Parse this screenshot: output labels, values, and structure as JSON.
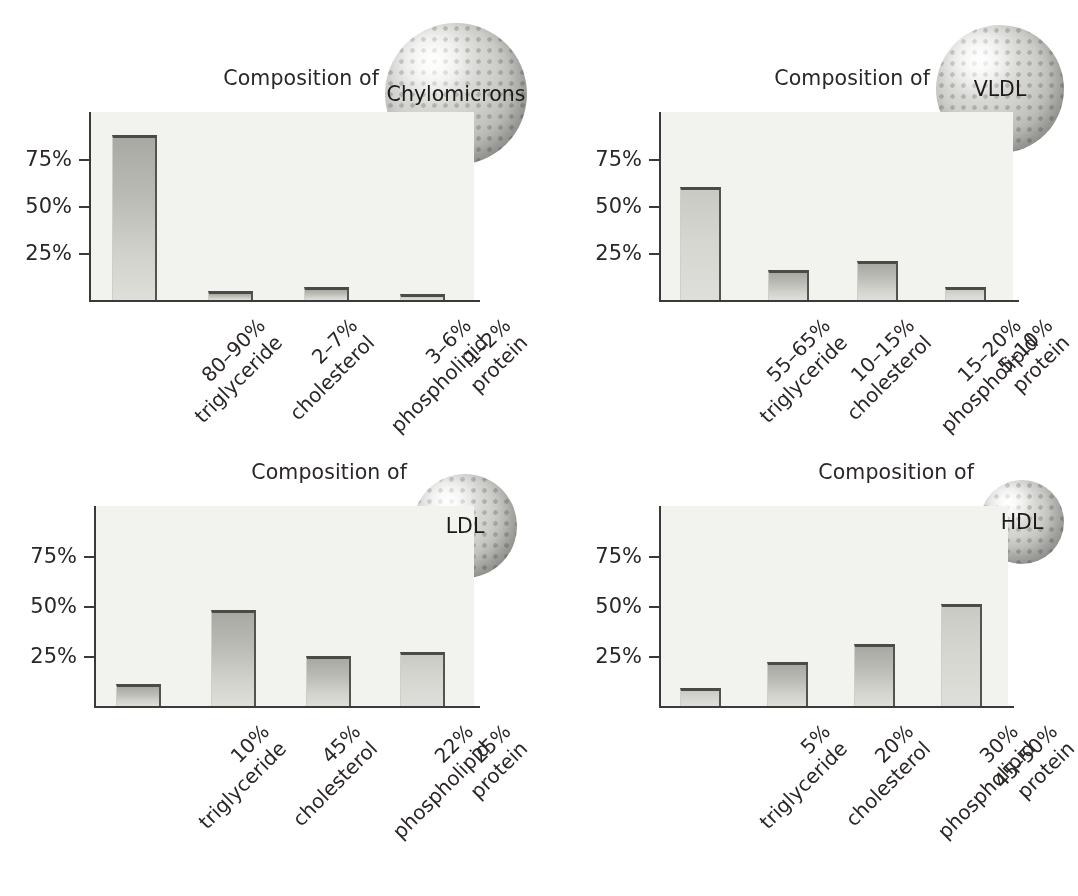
{
  "figure": {
    "title_prefix": "Composition of",
    "y_axis": {
      "ticks": [
        "25%",
        "50%",
        "75%"
      ],
      "tick_values": [
        25,
        50,
        75
      ],
      "max": 100
    }
  },
  "panels": [
    {
      "id": "chylomicrons",
      "name": "Chylomicrons",
      "title": "Composition of",
      "sphere_label": "Chylomicrons",
      "bars": [
        {
          "value": 88,
          "label_top": "80–90%",
          "label_bottom": "triglyceride",
          "tone": "mid"
        },
        {
          "value": 5,
          "label_top": "2–7%",
          "label_bottom": "cholesterol",
          "tone": "mid"
        },
        {
          "value": 7,
          "label_top": "3–6%",
          "label_bottom": "phospholipid",
          "tone": "mid"
        },
        {
          "value": 3,
          "label_top": "1–2%",
          "label_bottom": "protein",
          "tone": "light"
        }
      ]
    },
    {
      "id": "vldl",
      "name": "VLDL",
      "title": "Composition of",
      "sphere_label": "VLDL",
      "bars": [
        {
          "value": 60,
          "label_top": "55–65%",
          "label_bottom": "triglyceride",
          "tone": "light"
        },
        {
          "value": 16,
          "label_top": "10–15%",
          "label_bottom": "cholesterol",
          "tone": "mid"
        },
        {
          "value": 21,
          "label_top": "15–20%",
          "label_bottom": "phospholipid",
          "tone": "mid"
        },
        {
          "value": 7,
          "label_top": "5–10%",
          "label_bottom": "protein",
          "tone": "light"
        }
      ]
    },
    {
      "id": "ldl",
      "name": "LDL",
      "title": "Composition of",
      "sphere_label": "LDL",
      "bars": [
        {
          "value": 11,
          "label_top": "10%",
          "label_bottom": "triglyceride",
          "tone": "mid"
        },
        {
          "value": 48,
          "label_top": "45%",
          "label_bottom": "cholesterol",
          "tone": "mid"
        },
        {
          "value": 25,
          "label_top": "22%",
          "label_bottom": "phospholipid",
          "tone": "mid"
        },
        {
          "value": 27,
          "label_top": "25%",
          "label_bottom": "protein",
          "tone": "light"
        }
      ]
    },
    {
      "id": "hdl",
      "name": "HDL",
      "title": "Composition of",
      "sphere_label": "HDL",
      "bars": [
        {
          "value": 9,
          "label_top": "5%",
          "label_bottom": "triglyceride",
          "tone": "light"
        },
        {
          "value": 22,
          "label_top": "20%",
          "label_bottom": "cholesterol",
          "tone": "mid"
        },
        {
          "value": 31,
          "label_top": "30%",
          "label_bottom": "phospholipid",
          "tone": "mid"
        },
        {
          "value": 51,
          "label_top": "45–50%",
          "label_bottom": "protein",
          "tone": "light"
        }
      ]
    }
  ],
  "chart_data": {
    "type": "bar",
    "xlabel": "",
    "ylabel": "",
    "ylim": [
      0,
      100
    ],
    "yticks": [
      25,
      50,
      75
    ],
    "ytick_labels": [
      "25%",
      "50%",
      "75%"
    ],
    "grid": false,
    "legend": "none",
    "categories": [
      "triglyceride",
      "cholesterol",
      "phospholipid",
      "protein"
    ],
    "panels": [
      {
        "title": "Composition of Chylomicrons",
        "particle": "Chylomicrons",
        "categories": [
          "80–90% triglyceride",
          "2–7% cholesterol",
          "3–6% phospholipid",
          "1–2% protein"
        ],
        "values": [
          88,
          5,
          7,
          3
        ],
        "stated_ranges": [
          "80-90",
          "2-7",
          "3-6",
          "1-2"
        ]
      },
      {
        "title": "Composition of VLDL",
        "particle": "VLDL",
        "categories": [
          "55–65% triglyceride",
          "10–15% cholesterol",
          "15–20% phospholipid",
          "5–10% protein"
        ],
        "values": [
          60,
          16,
          21,
          7
        ],
        "stated_ranges": [
          "55-65",
          "10-15",
          "15-20",
          "5-10"
        ]
      },
      {
        "title": "Composition of LDL",
        "particle": "LDL",
        "categories": [
          "10% triglyceride",
          "45% cholesterol",
          "22% phospholipid",
          "25% protein"
        ],
        "values": [
          11,
          48,
          25,
          27
        ],
        "stated_ranges": [
          "10",
          "45",
          "22",
          "25"
        ]
      },
      {
        "title": "Composition of HDL",
        "particle": "HDL",
        "categories": [
          "5% triglyceride",
          "20% cholesterol",
          "30% phospholipid",
          "45–50% protein"
        ],
        "values": [
          9,
          22,
          31,
          51
        ],
        "stated_ranges": [
          "5",
          "20",
          "30",
          "45-50"
        ]
      }
    ]
  },
  "colors": {
    "background": "#ffffff",
    "plot_area": "#f2f2ef",
    "axis": "#3b3a38",
    "bar_fill_light": "#dedfd9",
    "bar_fill_dark": "#a9a9a4",
    "bar_edge": "#4b4a47",
    "text": "#2b2726",
    "sphere": "#c4c4c0"
  }
}
